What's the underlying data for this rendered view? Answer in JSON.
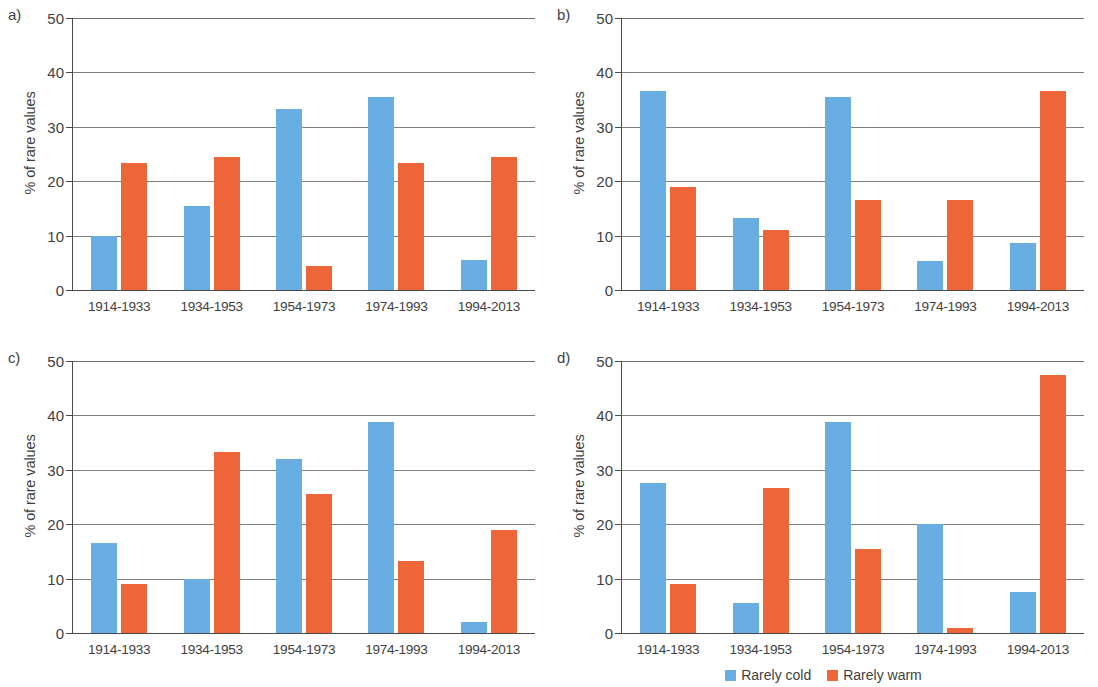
{
  "figure": {
    "panels": [
      "a)",
      "b)",
      "c)",
      "d)"
    ],
    "y_axis_title": "% of rare values",
    "y_ticks": [
      "0",
      "10",
      "20",
      "30",
      "40",
      "50"
    ],
    "x_categories": [
      "1914-1933",
      "1934-1953",
      "1954-1973",
      "1974-1993",
      "1994-2013"
    ],
    "legend": [
      {
        "label": "Rarely cold",
        "color": "#69AEE2"
      },
      {
        "label": "Rarely warm",
        "color": "#EE6637"
      }
    ]
  },
  "chart_data": [
    {
      "type": "bar",
      "panel": "a)",
      "title": "",
      "xlabel": "",
      "ylabel": "% of rare values",
      "ylim": [
        0,
        50
      ],
      "yticks": [
        0,
        10,
        20,
        30,
        40,
        50
      ],
      "grid": true,
      "legend_position": "figure-bottom",
      "categories": [
        "1914-1933",
        "1934-1953",
        "1954-1973",
        "1974-1993",
        "1994-2013"
      ],
      "series": [
        {
          "name": "Rarely cold",
          "color": "#69AEE2",
          "values": [
            10.0,
            15.5,
            33.3,
            35.5,
            5.5
          ]
        },
        {
          "name": "Rarely warm",
          "color": "#EE6637",
          "values": [
            23.3,
            24.5,
            4.4,
            23.3,
            24.5
          ]
        }
      ]
    },
    {
      "type": "bar",
      "panel": "b)",
      "title": "",
      "xlabel": "",
      "ylabel": "% of rare values",
      "ylim": [
        0,
        50
      ],
      "yticks": [
        0,
        10,
        20,
        30,
        40,
        50
      ],
      "grid": true,
      "legend_position": "figure-bottom",
      "categories": [
        "1914-1933",
        "1934-1953",
        "1954-1973",
        "1974-1993",
        "1994-2013"
      ],
      "series": [
        {
          "name": "Rarely cold",
          "color": "#69AEE2",
          "values": [
            36.6,
            13.2,
            35.5,
            5.3,
            8.7
          ]
        },
        {
          "name": "Rarely warm",
          "color": "#EE6637",
          "values": [
            18.9,
            11.1,
            16.5,
            16.5,
            36.6
          ]
        }
      ]
    },
    {
      "type": "bar",
      "panel": "c)",
      "title": "",
      "xlabel": "",
      "ylabel": "% of rare values",
      "ylim": [
        0,
        50
      ],
      "yticks": [
        0,
        10,
        20,
        30,
        40,
        50
      ],
      "grid": true,
      "legend_position": "figure-bottom",
      "categories": [
        "1914-1933",
        "1934-1953",
        "1954-1973",
        "1974-1993",
        "1994-2013"
      ],
      "series": [
        {
          "name": "Rarely cold",
          "color": "#69AEE2",
          "values": [
            16.6,
            10.0,
            32.0,
            38.8,
            2.0
          ]
        },
        {
          "name": "Rarely warm",
          "color": "#EE6637",
          "values": [
            9.0,
            33.3,
            25.5,
            13.3,
            18.9
          ]
        }
      ]
    },
    {
      "type": "bar",
      "panel": "d)",
      "title": "",
      "xlabel": "",
      "ylabel": "% of rare values",
      "ylim": [
        0,
        50
      ],
      "yticks": [
        0,
        10,
        20,
        30,
        40,
        50
      ],
      "grid": true,
      "legend_position": "figure-bottom",
      "categories": [
        "1914-1933",
        "1934-1953",
        "1954-1973",
        "1974-1993",
        "1994-2013"
      ],
      "series": [
        {
          "name": "Rarely cold",
          "color": "#69AEE2",
          "values": [
            27.5,
            5.5,
            38.8,
            20.0,
            7.5
          ]
        },
        {
          "name": "Rarely warm",
          "color": "#EE6637",
          "values": [
            9.0,
            26.6,
            15.5,
            1.0,
            47.5
          ]
        }
      ]
    }
  ]
}
